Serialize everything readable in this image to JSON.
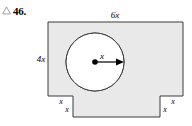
{
  "exercise": {
    "marker_icon": "triangle-outline-icon",
    "number": "46."
  },
  "figure": {
    "name": "composite-shape-with-circular-hole",
    "fill_color": "#e9e9e9",
    "stroke_color": "#3a3a3a",
    "labels": {
      "top_width": "6x",
      "left_height": "4x",
      "circle_radius": "x",
      "left_notch_width": "x",
      "left_notch_depth": "x",
      "right_notch_depth": "x",
      "right_notch_width": "x"
    },
    "parts": {
      "circle_name": "circular-hole",
      "center_dot_name": "circle-center-dot",
      "radius_arrow_name": "radius-arrow"
    }
  }
}
